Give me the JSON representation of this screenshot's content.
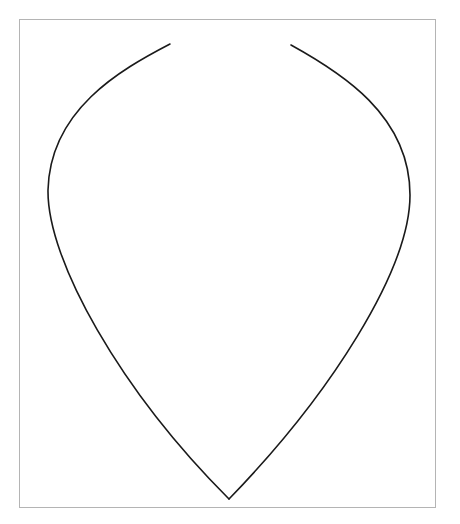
{
  "diagram": {
    "shape": "teardrop-outline",
    "stroke_color": "#1a1a1a",
    "frame_border_color": "#b4b4b4",
    "background_color": "#ffffff",
    "segments": [
      {
        "name": "left-side-curve"
      },
      {
        "name": "right-side-curve"
      }
    ]
  }
}
